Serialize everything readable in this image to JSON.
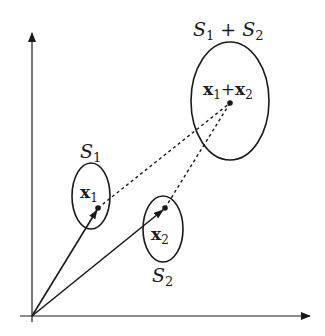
{
  "diagram": {
    "type": "vector-sum-of-sets",
    "axes": {
      "x_axis": "horizontal-axis",
      "y_axis": "vertical-axis"
    },
    "sets": [
      {
        "id": "S1",
        "label_base": "S",
        "label_sub": "1"
      },
      {
        "id": "S2",
        "label_base": "S",
        "label_sub": "2"
      },
      {
        "id": "S1+S2",
        "label_a_base": "S",
        "label_a_sub": "1",
        "operator": "+",
        "label_b_base": "S",
        "label_b_sub": "2"
      }
    ],
    "points": [
      {
        "id": "x1",
        "label_base": "x",
        "label_sub": "1"
      },
      {
        "id": "x2",
        "label_base": "x",
        "label_sub": "2"
      },
      {
        "id": "x1+x2",
        "label_a_base": "x",
        "label_a_sub": "1",
        "operator": "+",
        "label_b_base": "x",
        "label_b_sub": "2"
      }
    ],
    "colors": {
      "stroke": "#1a1a1a",
      "background": "#ffffff"
    }
  }
}
